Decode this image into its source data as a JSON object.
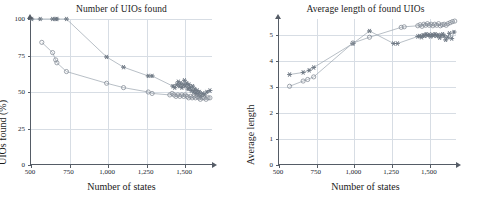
{
  "figure": {
    "background": "#ffffff",
    "axis_color": "#555c66",
    "grid_color": "#d7dde4",
    "marker_color": "#7f8792",
    "line_color": "#9aa3ad"
  },
  "charts": [
    {
      "id": "uios-found",
      "type": "scatter",
      "title": "Number of UIOs found",
      "xlabel": "Number of states",
      "ylabel": "UIOs found (%)",
      "xlim": [
        500,
        1680
      ],
      "ylim": [
        0,
        100
      ],
      "xticks": [
        500,
        750,
        1000,
        1250,
        1500
      ],
      "xticklabels": [
        "500",
        "750",
        "1,000",
        "1,250",
        "1,500"
      ],
      "yticks": [
        0,
        25,
        50,
        75,
        100
      ],
      "yticklabels": [
        "0",
        "25",
        "50",
        "75",
        "100"
      ],
      "grid": true,
      "legend": "none",
      "series": [
        {
          "name": "star-series",
          "marker": "star",
          "points": [
            [
              505,
              100
            ],
            [
              560,
              100
            ],
            [
              640,
              100
            ],
            [
              660,
              100
            ],
            [
              668,
              100
            ],
            [
              730,
              100
            ],
            [
              990,
              74
            ],
            [
              1100,
              67
            ],
            [
              1260,
              61
            ],
            [
              1285,
              61
            ],
            [
              1420,
              54
            ],
            [
              1432,
              53
            ],
            [
              1445,
              55
            ],
            [
              1455,
              57
            ],
            [
              1462,
              54
            ],
            [
              1470,
              56
            ],
            [
              1478,
              53
            ],
            [
              1488,
              55
            ],
            [
              1495,
              58
            ],
            [
              1502,
              54
            ],
            [
              1510,
              56
            ],
            [
              1518,
              52
            ],
            [
              1525,
              55
            ],
            [
              1532,
              53
            ],
            [
              1540,
              51
            ],
            [
              1548,
              54
            ],
            [
              1555,
              50
            ],
            [
              1562,
              52
            ],
            [
              1570,
              49
            ],
            [
              1578,
              51
            ],
            [
              1585,
              48
            ],
            [
              1592,
              50
            ],
            [
              1600,
              47
            ],
            [
              1612,
              49
            ],
            [
              1625,
              48
            ],
            [
              1640,
              50
            ],
            [
              1660,
              51
            ]
          ]
        },
        {
          "name": "circle-series",
          "marker": "circle",
          "points": [
            [
              570,
              84
            ],
            [
              640,
              77
            ],
            [
              660,
              72
            ],
            [
              668,
              70
            ],
            [
              730,
              64
            ],
            [
              990,
              56
            ],
            [
              1100,
              53
            ],
            [
              1260,
              50
            ],
            [
              1285,
              49
            ],
            [
              1400,
              48
            ],
            [
              1415,
              49
            ],
            [
              1428,
              48
            ],
            [
              1440,
              47
            ],
            [
              1452,
              48
            ],
            [
              1465,
              47
            ],
            [
              1478,
              48
            ],
            [
              1490,
              47
            ],
            [
              1500,
              48
            ],
            [
              1512,
              47
            ],
            [
              1522,
              46
            ],
            [
              1535,
              47
            ],
            [
              1545,
              46
            ],
            [
              1556,
              47
            ],
            [
              1566,
              46
            ],
            [
              1578,
              47
            ],
            [
              1588,
              46
            ],
            [
              1598,
              45
            ],
            [
              1610,
              46
            ],
            [
              1622,
              46
            ],
            [
              1635,
              45
            ],
            [
              1648,
              46
            ],
            [
              1660,
              46
            ]
          ]
        }
      ]
    },
    {
      "id": "avg-length",
      "type": "scatter",
      "title": "Average length of found UIOs",
      "xlabel": "Number of states",
      "ylabel": "Average length",
      "xlim": [
        500,
        1680
      ],
      "ylim": [
        0,
        5.6
      ],
      "xticks": [
        500,
        750,
        1000,
        1250,
        1500
      ],
      "xticklabels": [
        "500",
        "750",
        "1,000",
        "1,250",
        "1,500"
      ],
      "yticks": [
        0,
        1,
        2,
        3,
        4,
        5
      ],
      "yticklabels": [
        "0",
        "1",
        "2",
        "3",
        "4",
        "5"
      ],
      "grid": true,
      "legend": "none",
      "series": [
        {
          "name": "star-series",
          "marker": "star",
          "points": [
            [
              570,
              3.47
            ],
            [
              660,
              3.55
            ],
            [
              700,
              3.63
            ],
            [
              730,
              3.74
            ],
            [
              990,
              4.66
            ],
            [
              1100,
              5.14
            ],
            [
              1260,
              4.66
            ],
            [
              1285,
              4.66
            ],
            [
              1420,
              4.93
            ],
            [
              1432,
              4.95
            ],
            [
              1445,
              4.9
            ],
            [
              1455,
              4.98
            ],
            [
              1465,
              4.95
            ],
            [
              1475,
              5.02
            ],
            [
              1485,
              4.97
            ],
            [
              1495,
              5.0
            ],
            [
              1505,
              4.93
            ],
            [
              1515,
              5.0
            ],
            [
              1525,
              4.96
            ],
            [
              1535,
              5.02
            ],
            [
              1545,
              4.95
            ],
            [
              1555,
              4.99
            ],
            [
              1565,
              4.88
            ],
            [
              1575,
              4.97
            ],
            [
              1585,
              5.02
            ],
            [
              1595,
              4.95
            ],
            [
              1605,
              4.8
            ],
            [
              1618,
              4.9
            ],
            [
              1630,
              5.05
            ],
            [
              1645,
              4.85
            ],
            [
              1660,
              5.1
            ]
          ]
        },
        {
          "name": "circle-series",
          "marker": "circle",
          "points": [
            [
              570,
              3.02
            ],
            [
              660,
              3.22
            ],
            [
              690,
              3.28
            ],
            [
              730,
              3.38
            ],
            [
              990,
              4.68
            ],
            [
              1100,
              4.9
            ],
            [
              1310,
              5.28
            ],
            [
              1330,
              5.3
            ],
            [
              1420,
              5.34
            ],
            [
              1435,
              5.38
            ],
            [
              1448,
              5.32
            ],
            [
              1460,
              5.4
            ],
            [
              1472,
              5.36
            ],
            [
              1484,
              5.42
            ],
            [
              1496,
              5.36
            ],
            [
              1508,
              5.4
            ],
            [
              1520,
              5.34
            ],
            [
              1532,
              5.4
            ],
            [
              1545,
              5.36
            ],
            [
              1558,
              5.42
            ],
            [
              1570,
              5.34
            ],
            [
              1582,
              5.38
            ],
            [
              1595,
              5.4
            ],
            [
              1608,
              5.36
            ],
            [
              1620,
              5.42
            ],
            [
              1635,
              5.46
            ],
            [
              1650,
              5.5
            ],
            [
              1665,
              5.52
            ]
          ]
        }
      ]
    }
  ]
}
